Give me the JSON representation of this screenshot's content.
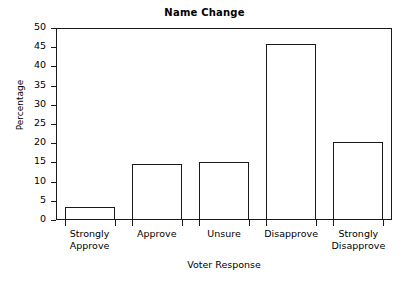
{
  "chart_data": {
    "type": "bar",
    "title": "Name Change",
    "xlabel": "Voter Response",
    "ylabel": "Percentage",
    "categories": [
      "Strongly\nApprove",
      "Approve",
      "Unsure",
      "Disapprove",
      "Strongly\nDisapprove"
    ],
    "values": [
      3.5,
      14.7,
      15.1,
      45.8,
      20.3
    ],
    "ylim": [
      0,
      50
    ],
    "yticks": [
      0,
      5,
      10,
      15,
      20,
      25,
      30,
      35,
      40,
      45,
      50
    ],
    "ytick_labels": [
      "0",
      "5",
      "10",
      "15",
      "20",
      "25",
      "30",
      "35",
      "40",
      "45",
      "50"
    ],
    "grid": false,
    "legend": false,
    "bar_fill_color": "#ffffff",
    "bar_edge_color": "#1a1a1a",
    "axis_color": "#1a1a1a",
    "background_color": "#ffffff"
  }
}
